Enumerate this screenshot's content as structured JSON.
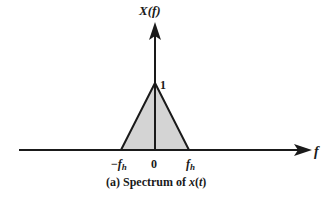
{
  "diagram": {
    "y_axis_label_main": "X(",
    "y_axis_label_var": "f",
    "y_axis_label_close": ")",
    "x_axis_label": "f",
    "peak_label": "1",
    "ticks": {
      "neg_minus": "−",
      "neg_f": "f",
      "neg_sub": "h",
      "zero": "0",
      "pos_f": "f",
      "pos_sub": "h"
    },
    "caption_prefix": "(a) Spectrum of ",
    "caption_var": "x",
    "caption_open": "(",
    "caption_t": "t",
    "caption_close": ")",
    "colors": {
      "stroke": "#1a1a1a",
      "fill": "#d4d4d4",
      "background": "#ffffff"
    }
  }
}
